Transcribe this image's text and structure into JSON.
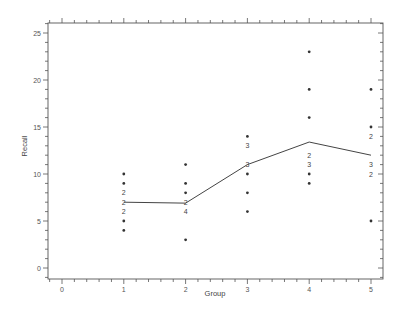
{
  "chart_data": {
    "type": "scatter",
    "title": "",
    "xlabel": "Group",
    "ylabel": "Recall",
    "xlim": [
      -0.22,
      5.2
    ],
    "ylim": [
      -1.1,
      26
    ],
    "x_ticks": [
      0,
      1,
      2,
      3,
      4,
      5
    ],
    "x_tick_labels": [
      "0",
      "1",
      "2",
      "3",
      "4",
      "5"
    ],
    "x_minor_step": 0.2,
    "y_ticks": [
      0,
      5,
      10,
      15,
      20,
      25
    ],
    "y_tick_labels": [
      "0",
      "5",
      "10",
      "15",
      "20",
      "25"
    ],
    "y_minor_step": 1,
    "grid": false,
    "legend": null,
    "marker_note": "Single dot = 1 observation; digit = number of coincident observations",
    "groups": [
      {
        "group": 1,
        "points": [
          {
            "y": 10,
            "n": 1
          },
          {
            "y": 9,
            "n": 1
          },
          {
            "y": 8,
            "n": 2
          },
          {
            "y": 7,
            "n": 2
          },
          {
            "y": 6,
            "n": 2
          },
          {
            "y": 5,
            "n": 1
          },
          {
            "y": 4,
            "n": 1
          }
        ]
      },
      {
        "group": 2,
        "points": [
          {
            "y": 11,
            "n": 1
          },
          {
            "y": 9,
            "n": 1
          },
          {
            "y": 8,
            "n": 1
          },
          {
            "y": 7,
            "n": 2
          },
          {
            "y": 6,
            "n": 4
          },
          {
            "y": 3,
            "n": 1
          }
        ]
      },
      {
        "group": 3,
        "points": [
          {
            "y": 14,
            "n": 1
          },
          {
            "y": 13,
            "n": 3
          },
          {
            "y": 11,
            "n": 3
          },
          {
            "y": 10,
            "n": 1
          },
          {
            "y": 8,
            "n": 1
          },
          {
            "y": 6,
            "n": 1
          }
        ]
      },
      {
        "group": 4,
        "points": [
          {
            "y": 23,
            "n": 1
          },
          {
            "y": 19,
            "n": 1
          },
          {
            "y": 16,
            "n": 1
          },
          {
            "y": 12,
            "n": 2
          },
          {
            "y": 11,
            "n": 3
          },
          {
            "y": 10,
            "n": 1
          },
          {
            "y": 9,
            "n": 1
          }
        ]
      },
      {
        "group": 5,
        "points": [
          {
            "y": 19,
            "n": 1
          },
          {
            "y": 15,
            "n": 1
          },
          {
            "y": 14,
            "n": 2
          },
          {
            "y": 11,
            "n": 3
          },
          {
            "y": 10,
            "n": 2
          },
          {
            "y": 5,
            "n": 1
          }
        ]
      }
    ],
    "series": [
      {
        "name": "group means",
        "type": "line",
        "x": [
          1,
          2,
          3,
          4,
          5
        ],
        "values": [
          7.0,
          6.9,
          11.0,
          13.4,
          12.0
        ]
      }
    ]
  }
}
